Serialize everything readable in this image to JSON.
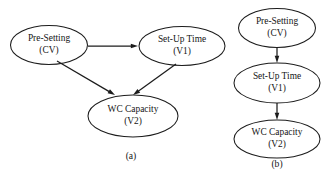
{
  "figure": {
    "background_color": "#ffffff",
    "stroke_color": "#1c1c1c",
    "text_color": "#151515"
  },
  "panels": [
    {
      "id": "panel-a",
      "caption": "(a)",
      "caption_x": 131,
      "caption_y": 157,
      "nodes": [
        {
          "id": "a-pre-setting",
          "name": "pre-setting",
          "line1": "Pre-Setting",
          "line2": "(CV)",
          "cx": 49,
          "cy": 45,
          "rx": 38.5,
          "ry": 19.5
        },
        {
          "id": "a-set-up-time",
          "name": "set-up-time",
          "line1": "Set-Up Time",
          "line2": "(V1)",
          "cx": 182,
          "cy": 46,
          "rx": 43,
          "ry": 19.5
        },
        {
          "id": "a-wc-capacity",
          "name": "wc-capacity",
          "line1": "WC Capacity",
          "line2": "(V2)",
          "cx": 133,
          "cy": 116,
          "rx": 45,
          "ry": 21
        }
      ],
      "edges": [
        {
          "id": "a-edge-presetting-to-setuptime",
          "name": "edge-pre-setting-to-set-up-time",
          "from": "a-pre-setting",
          "to": "a-set-up-time",
          "x1": 88,
          "y1": 46,
          "x2": 138,
          "y2": 46
        },
        {
          "id": "a-edge-presetting-to-wccapacity",
          "name": "edge-pre-setting-to-wc-capacity",
          "from": "a-pre-setting",
          "to": "a-wc-capacity",
          "x1": 57,
          "y1": 61,
          "x2": 115,
          "y2": 95
        },
        {
          "id": "a-edge-setuptime-to-wccapacity",
          "name": "edge-set-up-time-to-wc-capacity",
          "from": "a-set-up-time",
          "to": "a-wc-capacity",
          "x1": 176,
          "y1": 64,
          "x2": 133,
          "y2": 95
        }
      ]
    },
    {
      "id": "panel-b",
      "caption": "(b)",
      "caption_x": 277,
      "caption_y": 165,
      "nodes": [
        {
          "id": "b-pre-setting",
          "name": "pre-setting",
          "line1": "Pre-Setting",
          "line2": "(CV)",
          "cx": 277,
          "cy": 28,
          "rx": 38.5,
          "ry": 19.5
        },
        {
          "id": "b-set-up-time",
          "name": "set-up-time",
          "line1": "Set-Up Time",
          "line2": "(V1)",
          "cx": 277,
          "cy": 83,
          "rx": 43,
          "ry": 20
        },
        {
          "id": "b-wc-capacity",
          "name": "wc-capacity",
          "line1": "WC Capacity",
          "line2": "(V2)",
          "cx": 277,
          "cy": 139,
          "rx": 43,
          "ry": 19
        }
      ],
      "edges": [
        {
          "id": "b-edge-presetting-to-setuptime",
          "name": "edge-pre-setting-to-set-up-time",
          "from": "b-pre-setting",
          "to": "b-set-up-time",
          "x1": 277,
          "y1": 47,
          "x2": 277,
          "y2": 63
        },
        {
          "id": "b-edge-setuptime-to-wccapacity",
          "name": "edge-set-up-time-to-wc-capacity",
          "from": "b-set-up-time",
          "to": "b-wc-capacity",
          "x1": 277,
          "y1": 103,
          "x2": 277,
          "y2": 120
        }
      ]
    }
  ]
}
